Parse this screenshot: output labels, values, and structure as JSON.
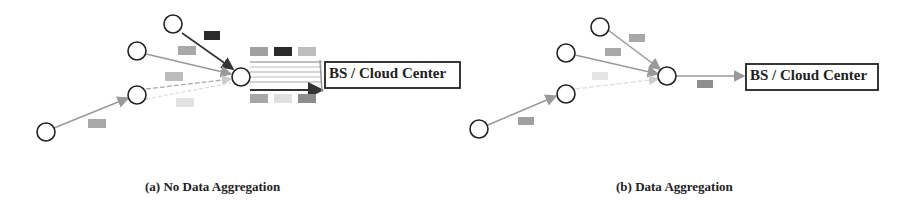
{
  "panels": [
    {
      "id": "a",
      "caption": "(a) No Data Aggregation",
      "destination_label": "BS / Cloud Center"
    },
    {
      "id": "b",
      "caption": "(b) Data Aggregation",
      "destination_label": "BS / Cloud Center"
    }
  ],
  "colors": {
    "node_stroke": "#222222",
    "packet_dark": "#2a2a2a",
    "packet_mid": "#9a9a9a",
    "packet_light": "#c8c8c8",
    "packet_faint": "#e0e0e0",
    "edge": "#999999"
  }
}
